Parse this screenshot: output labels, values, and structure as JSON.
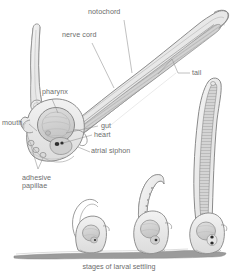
{
  "figure": {
    "style": "pencil line drawing, grayscale",
    "background_color": "#ffffff",
    "label_color": "#6d6d6d",
    "line_color": "#7a7a7a",
    "fill_color": "#d8d8d8",
    "substrate_color": "#9a9a9a"
  },
  "labels": {
    "notochord": "notochord",
    "nerve_cord": "nerve cord",
    "tail": "tail",
    "pharynx": "pharynx",
    "mouth": "mouth",
    "gut": "gut",
    "heart": "heart",
    "atrial_siphon": "atrial siphon",
    "adhesive_papillae_line1": "adhesive",
    "adhesive_papillae_line2": "papillae"
  },
  "caption": "stages of larval settling",
  "stages": [
    {
      "name": "stage-1-settled-early"
    },
    {
      "name": "stage-2-settled-mid"
    },
    {
      "name": "stage-3-settled-late"
    }
  ],
  "parts": [
    "detached-tail-fragment",
    "larva-head",
    "larva-tail",
    "substrate-line"
  ]
}
